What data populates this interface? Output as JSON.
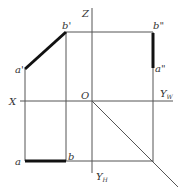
{
  "diagram": {
    "type": "orthographic-projection",
    "labels": {
      "z_axis": "Z",
      "x_axis": "X",
      "origin": "O",
      "yw_main": "Y",
      "yw_sub": "W",
      "yh_main": "Y",
      "yh_sub": "H",
      "b_prime": "b'",
      "a_prime": "a'",
      "b_double": "b\"",
      "a_double": "a\"",
      "a": "a",
      "b": "b"
    },
    "points": {
      "a_prime": [
        25,
        69
      ],
      "b_prime": [
        66,
        32
      ],
      "a_double": [
        153,
        68
      ],
      "b_double": [
        153,
        32
      ],
      "a": [
        25,
        161
      ],
      "b": [
        66,
        161
      ],
      "origin": [
        92,
        101
      ]
    },
    "colors": {
      "line": "#555555",
      "thick": "#111111"
    }
  }
}
